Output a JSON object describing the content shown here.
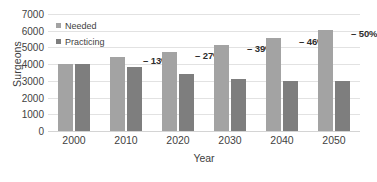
{
  "chart_data": {
    "type": "bar",
    "title": "",
    "xlabel": "Year",
    "ylabel": "Surgeons",
    "categories": [
      "2000",
      "2010",
      "2020",
      "2030",
      "2040",
      "2050"
    ],
    "series": [
      {
        "name": "Needed",
        "color": "#a3a3a3",
        "values": [
          4020,
          4400,
          4710,
          5150,
          5550,
          6050
        ]
      },
      {
        "name": "Practicing",
        "color": "#7e7e7e",
        "values": [
          4020,
          3830,
          3440,
          3140,
          3000,
          3020
        ]
      }
    ],
    "annotations": [
      "",
      "– 13%",
      "– 27%",
      "– 39%",
      "– 46%",
      "– 50%"
    ],
    "ylim": [
      0,
      7000
    ],
    "yticks": [
      0,
      1000,
      2000,
      3000,
      4000,
      5000,
      6000,
      7000
    ],
    "ytick_labels": [
      "0",
      "1000",
      "2000",
      "3000",
      "4000",
      "5000",
      "6000",
      "7000"
    ],
    "grid": true,
    "legend_position": "top-left"
  },
  "legend": {
    "items": [
      {
        "label": "Needed",
        "swatch": "legend-swatch-needed"
      },
      {
        "label": "Practicing",
        "swatch": "legend-swatch-practicing"
      }
    ]
  },
  "axes": {
    "y_title": "Surgeons",
    "x_title": "Year"
  }
}
